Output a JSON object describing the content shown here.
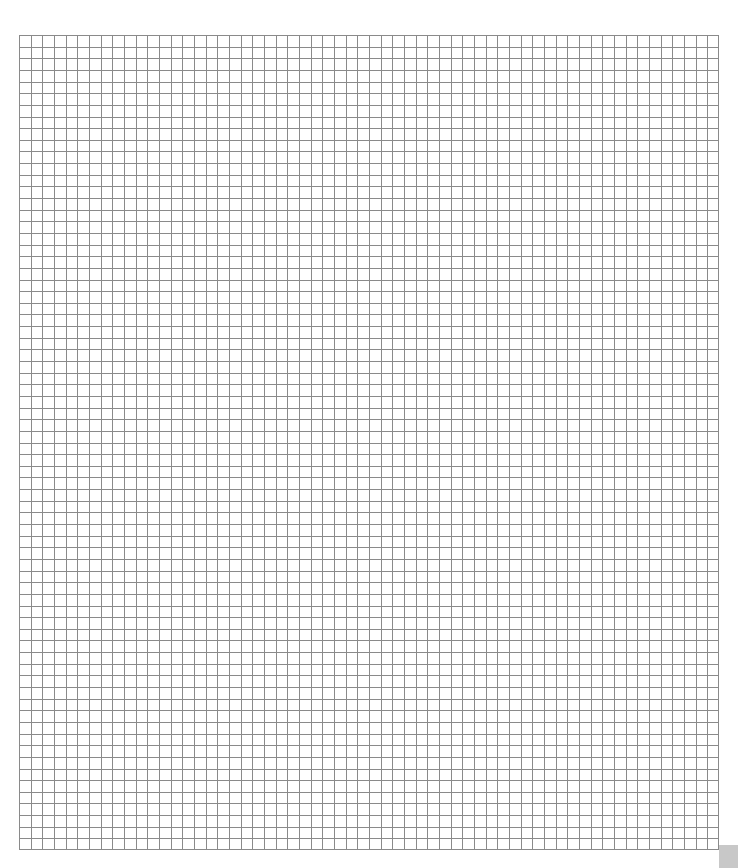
{
  "grid": {
    "columns": 60,
    "rows": 70,
    "line_color": "#8a8a8a",
    "background": "#ffffff"
  },
  "corner_box": {
    "color": "#c8c8c8"
  }
}
